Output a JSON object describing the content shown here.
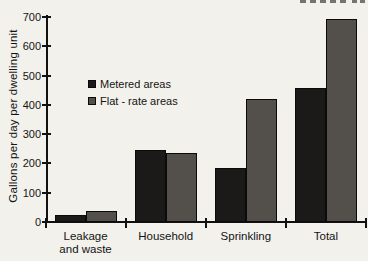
{
  "chart_data": {
    "type": "bar",
    "title": "",
    "categories": [
      [
        "Leakage",
        "and waste"
      ],
      [
        "Household"
      ],
      [
        "Sprinkling"
      ],
      [
        "Total"
      ]
    ],
    "series": [
      {
        "name": "Metered areas",
        "color": "#1b1a18",
        "values": [
          25,
          247,
          186,
          458
        ]
      },
      {
        "name": "Flat - rate areas",
        "color": "#53504b",
        "values": [
          36,
          236,
          420,
          692
        ]
      }
    ],
    "xlabel": "",
    "ylabel": "Gallons per day per dwelling unit",
    "ylim": [
      0,
      700
    ],
    "yticks": [
      0,
      100,
      200,
      300,
      400,
      500,
      600,
      700
    ],
    "grid": false,
    "legend_position": "inside upper-left"
  },
  "colors": {
    "background": "#f2f1ec",
    "axis": "#111111",
    "text": "#141414",
    "metered_bar": "#1b1a18",
    "flat_rate_bar": "#53504b"
  }
}
